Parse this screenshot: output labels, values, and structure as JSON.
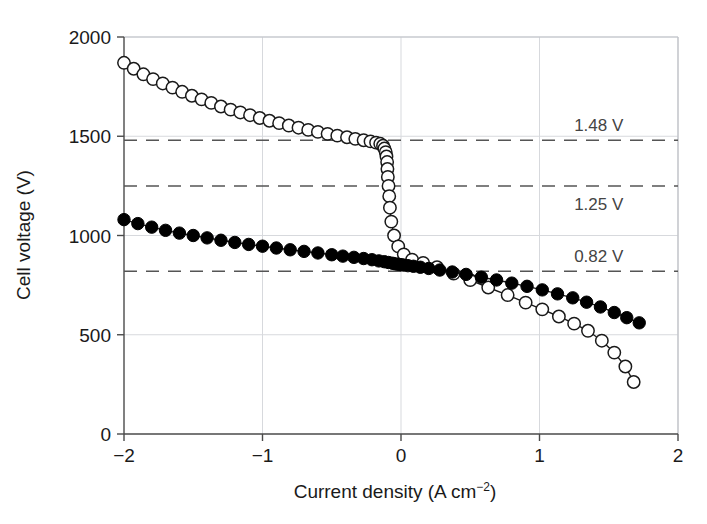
{
  "chart_data": {
    "type": "scatter",
    "title": "",
    "subtitle": "",
    "xlabel": "Current density (A cm",
    "xlabel_sup": "−2",
    "xlabel_tail": ")",
    "ylabel": "Cell voltage (V)",
    "xlim": [
      -2,
      2
    ],
    "ylim": [
      0,
      2000
    ],
    "xticks": [
      -2,
      -1,
      0,
      1,
      2
    ],
    "xtick_labels": [
      "−2",
      "−1",
      "0",
      "1",
      "2"
    ],
    "yticks": [
      0,
      500,
      1000,
      1500,
      2000
    ],
    "ytick_labels": [
      "0",
      "500",
      "1000",
      "1500",
      "2000"
    ],
    "grid": "light gridlines at major ticks",
    "legend_position": "none",
    "marker_colors": {
      "open": "#ffffff",
      "open_edge": "#1a1a1a",
      "filled": "#000000",
      "line": "#1a1a1a",
      "grid": "#d7d9dd",
      "frame": "#bfc2c7",
      "dashed": "#555555"
    },
    "annotations": [
      {
        "label": "1.48 V",
        "y": 1480,
        "x_text": 1.25,
        "position": "above-line"
      },
      {
        "label": "1.25 V",
        "y": 1250,
        "x_text": 1.25,
        "position": "below-line"
      },
      {
        "label": "0.82 V",
        "y": 820,
        "x_text": 1.25,
        "position": "above-line"
      }
    ],
    "series": [
      {
        "name": "open-circle series",
        "marker": "open-circle",
        "points": [
          [
            -2.0,
            1870
          ],
          [
            -1.93,
            1840
          ],
          [
            -1.86,
            1812
          ],
          [
            -1.79,
            1788
          ],
          [
            -1.72,
            1766
          ],
          [
            -1.65,
            1745
          ],
          [
            -1.58,
            1724
          ],
          [
            -1.51,
            1704
          ],
          [
            -1.44,
            1686
          ],
          [
            -1.37,
            1668
          ],
          [
            -1.3,
            1650
          ],
          [
            -1.23,
            1634
          ],
          [
            -1.16,
            1620
          ],
          [
            -1.09,
            1606
          ],
          [
            -1.02,
            1592
          ],
          [
            -0.95,
            1578
          ],
          [
            -0.88,
            1566
          ],
          [
            -0.81,
            1554
          ],
          [
            -0.74,
            1543
          ],
          [
            -0.67,
            1532
          ],
          [
            -0.6,
            1522
          ],
          [
            -0.53,
            1512
          ],
          [
            -0.46,
            1503
          ],
          [
            -0.39,
            1495
          ],
          [
            -0.33,
            1487
          ],
          [
            -0.27,
            1480
          ],
          [
            -0.22,
            1474
          ],
          [
            -0.18,
            1468
          ],
          [
            -0.15,
            1462
          ],
          [
            -0.13,
            1452
          ],
          [
            -0.12,
            1438
          ],
          [
            -0.11,
            1420
          ],
          [
            -0.105,
            1398
          ],
          [
            -0.1,
            1370
          ],
          [
            -0.098,
            1335
          ],
          [
            -0.095,
            1295
          ],
          [
            -0.09,
            1250
          ],
          [
            -0.085,
            1198
          ],
          [
            -0.08,
            1140
          ],
          [
            -0.07,
            1070
          ],
          [
            -0.05,
            1000
          ],
          [
            -0.02,
            945
          ],
          [
            0.02,
            905
          ],
          [
            0.08,
            878
          ],
          [
            0.16,
            862
          ],
          [
            0.26,
            840
          ],
          [
            0.38,
            808
          ],
          [
            0.5,
            775
          ],
          [
            0.63,
            738
          ],
          [
            0.77,
            700
          ],
          [
            0.9,
            662
          ],
          [
            1.02,
            628
          ],
          [
            1.14,
            592
          ],
          [
            1.25,
            556
          ],
          [
            1.35,
            520
          ],
          [
            1.45,
            470
          ],
          [
            1.54,
            410
          ],
          [
            1.62,
            340
          ],
          [
            1.68,
            262
          ]
        ]
      },
      {
        "name": "filled-circle series",
        "marker": "filled-circle",
        "points": [
          [
            -2.0,
            1080
          ],
          [
            -1.9,
            1060
          ],
          [
            -1.8,
            1042
          ],
          [
            -1.7,
            1026
          ],
          [
            -1.6,
            1012
          ],
          [
            -1.5,
            1000
          ],
          [
            -1.4,
            988
          ],
          [
            -1.3,
            976
          ],
          [
            -1.2,
            965
          ],
          [
            -1.1,
            955
          ],
          [
            -1.0,
            946
          ],
          [
            -0.9,
            937
          ],
          [
            -0.8,
            928
          ],
          [
            -0.7,
            920
          ],
          [
            -0.6,
            912
          ],
          [
            -0.5,
            903
          ],
          [
            -0.42,
            896
          ],
          [
            -0.34,
            890
          ],
          [
            -0.27,
            884
          ],
          [
            -0.21,
            878
          ],
          [
            -0.16,
            872
          ],
          [
            -0.12,
            868
          ],
          [
            -0.09,
            864
          ],
          [
            -0.06,
            860
          ],
          [
            -0.04,
            857
          ],
          [
            -0.02,
            855
          ],
          [
            0.0,
            853
          ],
          [
            0.02,
            851
          ],
          [
            0.05,
            848
          ],
          [
            0.09,
            845
          ],
          [
            0.14,
            840
          ],
          [
            0.2,
            834
          ],
          [
            0.28,
            826
          ],
          [
            0.37,
            816
          ],
          [
            0.47,
            804
          ],
          [
            0.58,
            790
          ],
          [
            0.69,
            776
          ],
          [
            0.8,
            760
          ],
          [
            0.91,
            744
          ],
          [
            1.02,
            726
          ],
          [
            1.13,
            706
          ],
          [
            1.24,
            686
          ],
          [
            1.34,
            664
          ],
          [
            1.44,
            640
          ],
          [
            1.54,
            612
          ],
          [
            1.63,
            586
          ],
          [
            1.72,
            560
          ]
        ]
      }
    ]
  }
}
